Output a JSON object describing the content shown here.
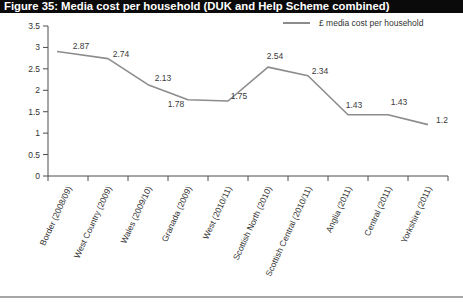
{
  "title_bar": {
    "text": "Figure 35: Media cost per household (DUK and Help Scheme combined)"
  },
  "legend": {
    "label": "£ media cost per household"
  },
  "colors": {
    "title_bar_bg": "#0a0a0a",
    "title_bar_text": "#ffffff",
    "line": "#8c8c8c",
    "axis": "#4d4d4d",
    "text": "#333333",
    "separator": "#a6a6a6"
  },
  "chart_data": {
    "type": "line",
    "title": "Figure 35: Media cost per household (DUK and Help Scheme combined)",
    "categories": [
      "Border (2008/09)",
      "West Country (2009)",
      "Wales (2009/10)",
      "Granada (2009)",
      "West (2010/11)",
      "Scottish North (2010)",
      "Scottish Central (2010/11)",
      "Anglia (2011)",
      "Central (2011)",
      "Yorkshire (2011)"
    ],
    "series": [
      {
        "name": "£ media cost per household",
        "values": [
          2.87,
          2.74,
          2.13,
          1.78,
          1.75,
          2.54,
          2.34,
          1.43,
          1.43,
          1.2
        ]
      }
    ],
    "xlabel": "",
    "ylabel": "",
    "ylim": [
      0,
      3.5
    ],
    "ytick_step": 0.5,
    "grid": false,
    "data_labels": true,
    "legend_position": "top-right"
  }
}
